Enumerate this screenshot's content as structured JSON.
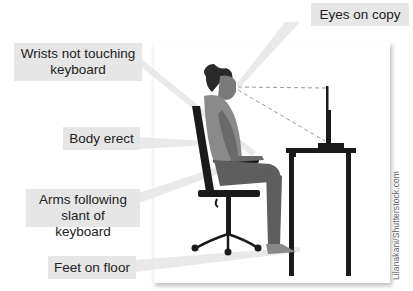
{
  "diagram": {
    "callouts": [
      {
        "id": "eyes",
        "label": "Eyes on copy"
      },
      {
        "id": "wrists",
        "label": "Wrists not touching keyboard"
      },
      {
        "id": "body",
        "label": "Body erect"
      },
      {
        "id": "arms",
        "label": "Arms following slant of keyboard"
      },
      {
        "id": "feet",
        "label": "Feet on floor"
      }
    ],
    "credit": "Lilanakani/Shutterstock.com",
    "colors": {
      "label_bg": "#e6e6e6",
      "pointer": "#e8e8e8",
      "furniture": "#1a1a1a",
      "skin": "#6e6e6e",
      "shirt": "#8a8a8a",
      "hair": "#2a2a2a"
    }
  }
}
